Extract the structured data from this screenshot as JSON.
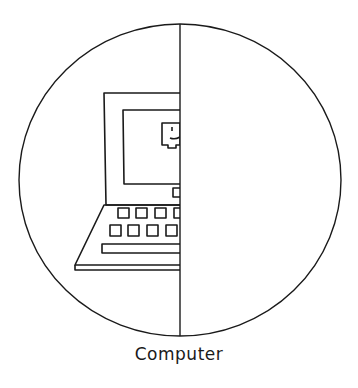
{
  "figure": {
    "caption": "Computer",
    "stroke_color": "#1a1a1a",
    "background": "#ffffff",
    "circle": {
      "cx": 180,
      "cy": 180,
      "rx": 161,
      "ry": 156
    },
    "divider_x": 180
  }
}
